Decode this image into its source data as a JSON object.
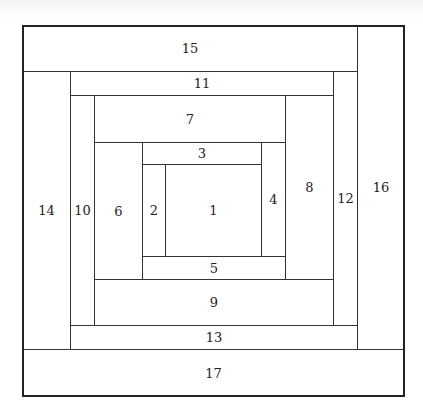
{
  "diagram": {
    "type": "log-cabin-quilt-block",
    "pieces": [
      {
        "label": "1",
        "x": 165,
        "y": 164,
        "w": 97,
        "h": 93
      },
      {
        "label": "2",
        "x": 142,
        "y": 164,
        "w": 24,
        "h": 93
      },
      {
        "label": "3",
        "x": 142,
        "y": 142,
        "w": 120,
        "h": 23
      },
      {
        "label": "4",
        "x": 261,
        "y": 142,
        "w": 25,
        "h": 115
      },
      {
        "label": "5",
        "x": 142,
        "y": 256,
        "w": 144,
        "h": 24
      },
      {
        "label": "6",
        "x": 94,
        "y": 142,
        "w": 49,
        "h": 138
      },
      {
        "label": "7",
        "x": 94,
        "y": 95,
        "w": 192,
        "h": 48
      },
      {
        "label": "8",
        "x": 285,
        "y": 95,
        "w": 49,
        "h": 185
      },
      {
        "label": "9",
        "x": 94,
        "y": 279,
        "w": 240,
        "h": 47
      },
      {
        "label": "10",
        "x": 70,
        "y": 95,
        "w": 25,
        "h": 231
      },
      {
        "label": "11",
        "x": 70,
        "y": 71,
        "w": 264,
        "h": 25
      },
      {
        "label": "12",
        "x": 333,
        "y": 71,
        "w": 25,
        "h": 255
      },
      {
        "label": "13",
        "x": 70,
        "y": 325,
        "w": 288,
        "h": 25
      },
      {
        "label": "14",
        "x": 22,
        "y": 71,
        "w": 49,
        "h": 279
      },
      {
        "label": "15",
        "x": 22,
        "y": 25,
        "w": 336,
        "h": 47
      },
      {
        "label": "16",
        "x": 357,
        "y": 25,
        "w": 48,
        "h": 325
      },
      {
        "label": "17",
        "x": 22,
        "y": 349,
        "w": 383,
        "h": 48
      }
    ],
    "outer": {
      "x": 22,
      "y": 25,
      "w": 383,
      "h": 372
    },
    "colors": {
      "line": "#333333",
      "fill": "#ffffff",
      "text": "#222222"
    }
  }
}
